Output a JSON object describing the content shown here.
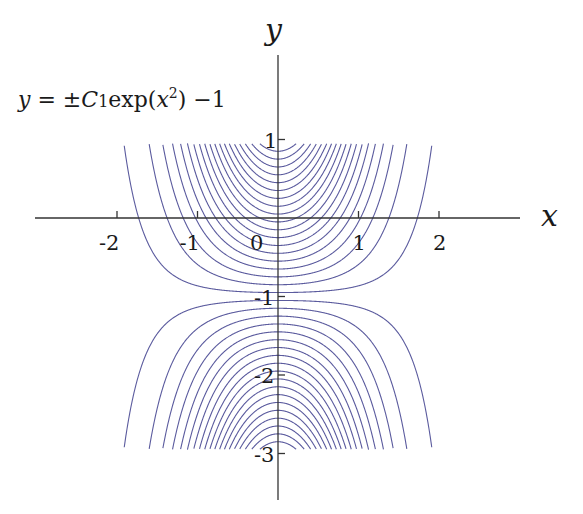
{
  "chart_data": {
    "type": "line",
    "title": "",
    "formula": "y = ±C₁exp(x²) − 1",
    "xlabel": "x",
    "ylabel": "y",
    "xlim": [
      -3,
      3
    ],
    "ylim": [
      -3.5,
      1.6
    ],
    "clip_y": [
      -2.95,
      0.95
    ],
    "x_ticks": [
      -2,
      -1,
      0,
      1,
      2
    ],
    "x_tick_labels": [
      "-2",
      "-1",
      "0",
      "1",
      "2"
    ],
    "y_ticks": [
      1,
      -1,
      -2,
      -3
    ],
    "y_tick_labels": [
      "1",
      "-1",
      "-2",
      "-3"
    ],
    "grid": false,
    "legend": "none",
    "line_color": "#5b5b9e",
    "series": [
      {
        "name": "upper family (C > 0)",
        "C_values": [
          0.05,
          0.15,
          0.25,
          0.35,
          0.45,
          0.55,
          0.65,
          0.75,
          0.85,
          0.95,
          1.05,
          1.15,
          1.25,
          1.35,
          1.45,
          1.55,
          1.65,
          1.75,
          1.85,
          1.95
        ]
      },
      {
        "name": "lower family (C < 0)",
        "C_values": [
          -0.05,
          -0.15,
          -0.25,
          -0.35,
          -0.45,
          -0.55,
          -0.65,
          -0.75,
          -0.85,
          -0.95,
          -1.05,
          -1.15,
          -1.25,
          -1.35,
          -1.45,
          -1.55,
          -1.65,
          -1.75,
          -1.85,
          -1.95
        ]
      }
    ]
  },
  "labels": {
    "x_axis": "x",
    "y_axis": "y",
    "formula_prefix": "y = ±C",
    "formula_sub": "1",
    "formula_mid": "exp(",
    "formula_var": "x",
    "formula_sup": "2",
    "formula_suffix": ") −1"
  }
}
